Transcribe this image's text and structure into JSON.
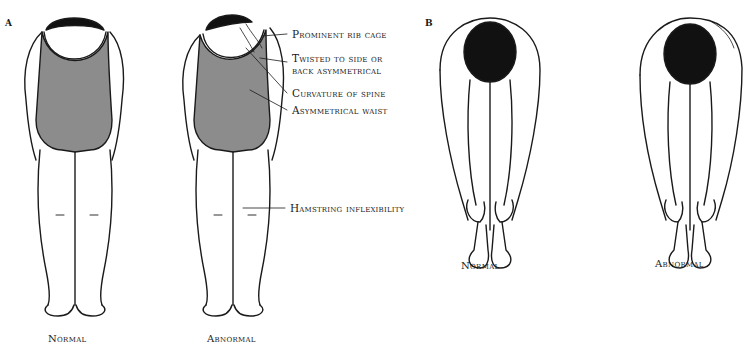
{
  "figure": {
    "panels": [
      {
        "letter": "A",
        "captions": [
          "Normal",
          "Abnormal"
        ]
      },
      {
        "letter": "B",
        "captions": [
          "Normal",
          "Abnormal"
        ]
      }
    ],
    "callouts": [
      "Prominent rib cage",
      "Twisted to side or",
      "back asymmetrical",
      "Curvature of spine",
      "Asymmetrical waist",
      "Hamstring inflexibility"
    ]
  },
  "colors": {
    "swimsuit": "#8c8c8c",
    "hair": "#111111",
    "line": "#1a1a1a",
    "background": "#ffffff"
  }
}
